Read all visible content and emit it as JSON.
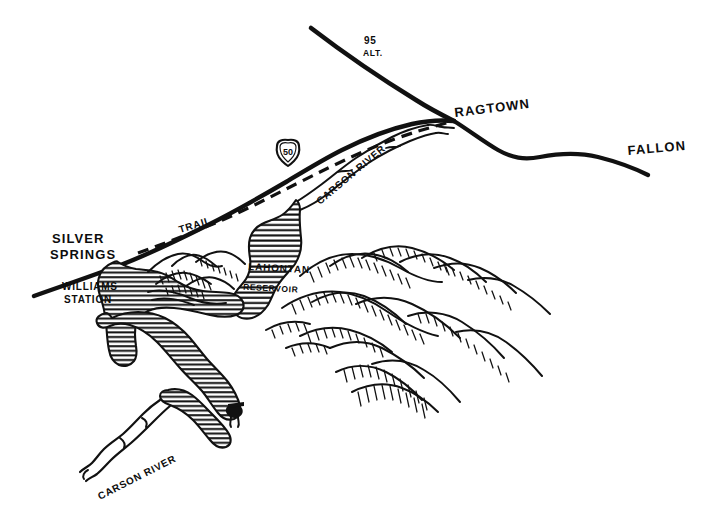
{
  "map": {
    "title": "Hand-drawn map of the Carson River / Lahontan Reservoir area, Nevada",
    "style": "pen-and-ink line drawing",
    "background_color": "#ffffff",
    "ink_color": "#111111",
    "width": 715,
    "height": 531,
    "place_labels": [
      {
        "name": "silver-springs",
        "text_line_1": "SILVER",
        "text_line_2": "SPRINGS",
        "x": 52,
        "y": 243,
        "rotation": 0
      },
      {
        "name": "williams-station",
        "text_line_1": "WILLIAMS",
        "text_line_2": "STATION",
        "x": 62,
        "y": 290,
        "rotation": 0
      },
      {
        "name": "ragtown",
        "text_line_1": "RAGTOWN",
        "text_line_2": "",
        "x": 455,
        "y": 117,
        "rotation": -7
      },
      {
        "name": "fallon",
        "text_line_1": "FALLON",
        "text_line_2": "",
        "x": 628,
        "y": 155,
        "rotation": -5
      }
    ],
    "feature_labels": [
      {
        "name": "lahontan-reservoir",
        "text_line_1": "LAHONTAN",
        "text_line_2": "RESERVOIR",
        "x": 248,
        "y": 270,
        "rotation": 3
      },
      {
        "name": "carson-river-upper",
        "text": "CARSON RIVER",
        "x": 320,
        "y": 205,
        "rotation": -40
      },
      {
        "name": "carson-river-lower",
        "text": "CARSON RIVER",
        "x": 100,
        "y": 500,
        "rotation": -27
      },
      {
        "name": "trail",
        "text": "TRAIL",
        "x": 180,
        "y": 233,
        "rotation": -17
      }
    ],
    "highways": [
      {
        "name": "route-95-alt",
        "label_line_1": "95",
        "label_line_2": "ALT.",
        "x": 364,
        "y": 44,
        "marker": "text"
      },
      {
        "name": "route-50-shield",
        "label": "50",
        "x": 288,
        "y": 156,
        "marker": "us-highway-shield"
      }
    ],
    "legend_features": [
      {
        "name": "road-line",
        "description": "solid heavy line = highway"
      },
      {
        "name": "dashed-line",
        "description": "dashed line = emigrant trail"
      },
      {
        "name": "hatched-area",
        "description": "horizontal hatching = water body / river"
      },
      {
        "name": "hill-hachure",
        "description": "hachured forms = hills and mountains"
      }
    ]
  }
}
